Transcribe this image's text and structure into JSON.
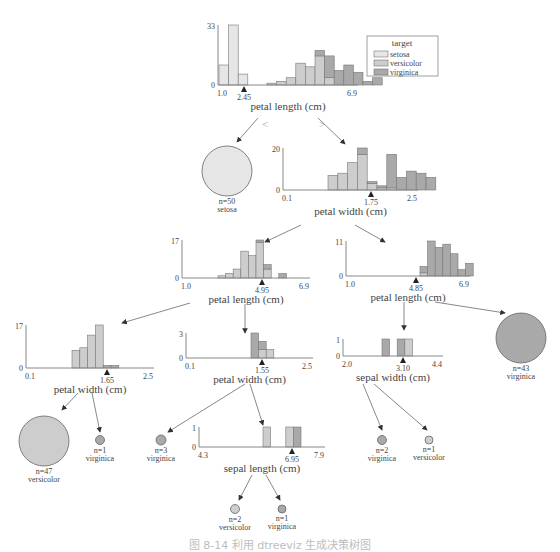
{
  "colors": {
    "setosa": "#e6e6e6",
    "versicolor": "#cdcdcd",
    "virginica": "#a9a9a9",
    "edge": "#6a6a6a",
    "axis": "#888888",
    "text": "#444444",
    "split_marker": "#222222"
  },
  "legend": {
    "title": "target",
    "items": [
      {
        "label": "setosa",
        "class": "setosa"
      },
      {
        "label": "versicolor",
        "class": "versicolor"
      },
      {
        "label": "virginica",
        "class": "virginica"
      }
    ]
  },
  "root_edge_labels": {
    "left": "<",
    "right": ">"
  },
  "chart_data": [
    {
      "id": "root",
      "type": "bar",
      "feature": "petal length (cm)",
      "xmin": "1.0",
      "xmax": "6.9",
      "ymax": "33",
      "ymin": "0",
      "split": "2.45",
      "series": [
        {
          "name": "setosa",
          "values": [
            11,
            33,
            6,
            0,
            0,
            0,
            0,
            0,
            0,
            0,
            0,
            0,
            0,
            0,
            0,
            0,
            0
          ]
        },
        {
          "name": "versicolor",
          "values": [
            0,
            0,
            0,
            0,
            0,
            1,
            2,
            4,
            12,
            10,
            16,
            4,
            0,
            0,
            0,
            0,
            0
          ]
        },
        {
          "name": "virginica",
          "values": [
            0,
            0,
            0,
            0,
            0,
            0,
            0,
            0,
            0,
            0,
            3,
            12,
            8,
            11,
            7,
            2,
            4
          ]
        }
      ]
    },
    {
      "id": "n_pw175",
      "type": "bar",
      "feature": "petal width (cm)",
      "xmin": "0.1",
      "xmax": "2.5",
      "ymax": "20",
      "ymin": "0",
      "split": "1.75",
      "series": [
        {
          "name": "versicolor",
          "values": [
            7,
            8,
            13,
            17,
            3,
            1,
            1,
            0,
            0,
            0,
            0
          ]
        },
        {
          "name": "virginica",
          "values": [
            0,
            0,
            0,
            3,
            1,
            1,
            16,
            6,
            9,
            8,
            6
          ]
        }
      ]
    },
    {
      "id": "n_pl495",
      "type": "bar",
      "feature": "petal length (cm)",
      "xmin": "1.0",
      "xmax": "6.9",
      "ymax": "17",
      "ymin": "0",
      "split": "4.95",
      "series": [
        {
          "name": "versicolor",
          "values": [
            1,
            2,
            4,
            12,
            10,
            16,
            4,
            0,
            0
          ]
        },
        {
          "name": "virginica",
          "values": [
            0,
            0,
            0,
            0,
            0,
            1,
            2,
            0,
            2
          ]
        }
      ]
    },
    {
      "id": "n_pl485",
      "type": "bar",
      "feature": "petal length (cm)",
      "xmin": "1.0",
      "xmax": "6.9",
      "ymax": "11",
      "ymin": "0",
      "split": "4.85",
      "series": [
        {
          "name": "versicolor",
          "values": [
            1,
            0,
            0,
            0,
            0,
            0,
            0
          ]
        },
        {
          "name": "virginica",
          "values": [
            2,
            11,
            9,
            10,
            7,
            2,
            4
          ]
        }
      ]
    },
    {
      "id": "n_pw165",
      "type": "bar",
      "feature": "petal width (cm)",
      "xmin": "0.1",
      "xmax": "2.5",
      "ymax": "17",
      "ymin": "0",
      "split": "1.65",
      "series": [
        {
          "name": "versicolor",
          "values": [
            7,
            8,
            13,
            17,
            0,
            0
          ]
        },
        {
          "name": "virginica",
          "values": [
            0,
            0,
            0,
            0,
            1,
            1
          ]
        }
      ]
    },
    {
      "id": "n_pw155",
      "type": "bar",
      "feature": "petal width (cm)",
      "xmin": "0.1",
      "xmax": "2.5",
      "ymax": "3",
      "ymin": "0",
      "split": "1.55",
      "series": [
        {
          "name": "versicolor",
          "values": [
            0,
            1,
            1
          ]
        },
        {
          "name": "virginica",
          "values": [
            3,
            1,
            0
          ]
        }
      ]
    },
    {
      "id": "n_sw310",
      "type": "bar",
      "feature": "sepal width (cm)",
      "xmin": "2.0",
      "xmax": "4.4",
      "ymax": "1",
      "ymin": "0",
      "split": "3.10",
      "series": [
        {
          "name": "virginica",
          "values": [
            1,
            0,
            1,
            0
          ]
        },
        {
          "name": "versicolor",
          "values": [
            0,
            0,
            0,
            1
          ]
        }
      ]
    },
    {
      "id": "n_sl695",
      "type": "bar",
      "feature": "sepal length (cm)",
      "xmin": "4.3",
      "xmax": "7.9",
      "ymax": "1",
      "ymin": "0",
      "split": "6.95",
      "series": [
        {
          "name": "versicolor",
          "values": [
            1,
            0,
            0,
            1,
            0
          ]
        },
        {
          "name": "virginica",
          "values": [
            0,
            0,
            0,
            0,
            1
          ]
        }
      ]
    }
  ],
  "leaves": [
    {
      "id": "leaf_setosa",
      "n": "n=50",
      "label": "setosa"
    },
    {
      "id": "leaf_virg43",
      "n": "n=43",
      "label": "virginica"
    },
    {
      "id": "leaf_vers47",
      "n": "n=47",
      "label": "versicolor"
    },
    {
      "id": "leaf_virg1a",
      "n": "n=1",
      "label": "virginica"
    },
    {
      "id": "leaf_virg3",
      "n": "n=3",
      "label": "virginica"
    },
    {
      "id": "leaf_virg2",
      "n": "n=2",
      "label": "virginica"
    },
    {
      "id": "leaf_vers1",
      "n": "n=1",
      "label": "versicolor"
    },
    {
      "id": "leaf_vers2",
      "n": "n=2",
      "label": "versicolor"
    },
    {
      "id": "leaf_virg1b",
      "n": "n=1",
      "label": "virginica"
    }
  ],
  "caption": "图 8-14  利用 dtreeviz 生成决策树图"
}
